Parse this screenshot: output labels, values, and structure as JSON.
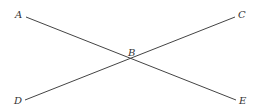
{
  "diagram": {
    "background": "#ffffff",
    "line_color": "#444444",
    "line_width": 1,
    "points": [
      {
        "label": "A",
        "x": 26,
        "y": 17,
        "label_x": 15,
        "label_y": 18
      },
      {
        "label": "C",
        "x": 235,
        "y": 17,
        "label_x": 238,
        "label_y": 18
      },
      {
        "label": "B",
        "x": 131,
        "y": 58,
        "label_x": 128,
        "label_y": 56
      },
      {
        "label": "D",
        "x": 25,
        "y": 100,
        "label_x": 14,
        "label_y": 104
      },
      {
        "label": "E",
        "x": 236,
        "y": 100,
        "label_x": 239,
        "label_y": 104
      }
    ],
    "segments": [
      {
        "name": "segment-ae",
        "from": "A",
        "to": "E",
        "x1": 26,
        "y1": 17,
        "x2": 236,
        "y2": 100
      },
      {
        "name": "segment-dc",
        "from": "D",
        "to": "C",
        "x1": 25,
        "y1": 100,
        "x2": 235,
        "y2": 17
      }
    ],
    "labels": {
      "A": "A",
      "B": "B",
      "C": "C",
      "D": "D",
      "E": "E"
    }
  }
}
